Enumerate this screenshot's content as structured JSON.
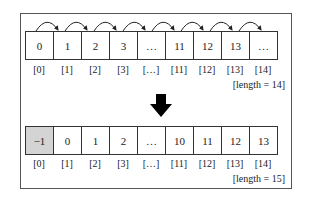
{
  "top_array": {
    "cells": [
      "0",
      "1",
      "2",
      "3",
      "…",
      "11",
      "12",
      "13",
      "…"
    ],
    "indices": [
      "[0]",
      "[1]",
      "[2]",
      "[3]",
      "[…]",
      "[11]",
      "[12]",
      "[13]",
      "[14]"
    ],
    "length_label": "[length = 14]"
  },
  "bottom_array": {
    "cells": [
      "−1",
      "0",
      "1",
      "2",
      "…",
      "10",
      "11",
      "12",
      "13"
    ],
    "indices": [
      "[0]",
      "[1]",
      "[2]",
      "[3]",
      "[…]",
      "[11]",
      "[12]",
      "[13]",
      "[14]"
    ],
    "length_label": "[length = 15]",
    "highlighted_index": 0
  },
  "arrow": {
    "direction": "down",
    "meaning": "transform"
  },
  "shift_arrows": {
    "count": 8,
    "direction": "right"
  },
  "colors": {
    "border": "#333333",
    "highlight": "#d4d4d4",
    "arrow": "#000000"
  }
}
